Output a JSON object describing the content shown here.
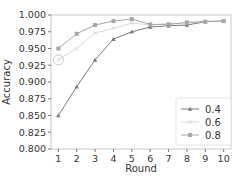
{
  "chart_data": {
    "type": "line",
    "title": "",
    "xlabel": "Round",
    "ylabel": "Accuracy",
    "x": [
      1,
      2,
      3,
      4,
      5,
      6,
      7,
      8,
      9,
      10
    ],
    "xticks": [
      "1",
      "2",
      "3",
      "4",
      "5",
      "6",
      "7",
      "8",
      "9",
      "10"
    ],
    "yticks": [
      "0.800",
      "0.825",
      "0.850",
      "0.875",
      "0.900",
      "0.925",
      "0.950",
      "0.975",
      "1.000"
    ],
    "ylim": [
      0.8,
      1.0
    ],
    "xlim": [
      0.6,
      10.4
    ],
    "grid": false,
    "legend_position": "lower right",
    "series": [
      {
        "name": "0.4",
        "marker": "triangle",
        "color": "#7a7a7a",
        "values": [
          0.85,
          0.893,
          0.933,
          0.964,
          0.975,
          0.982,
          0.984,
          0.985,
          0.99,
          0.991
        ]
      },
      {
        "name": "0.6",
        "marker": "x",
        "color": "#d9d9d9",
        "values": [
          0.933,
          0.95,
          0.973,
          0.98,
          0.988,
          0.985,
          0.987,
          0.988,
          0.991,
          0.991
        ]
      },
      {
        "name": "0.8",
        "marker": "square",
        "color": "#a6a6a6",
        "values": [
          0.95,
          0.972,
          0.985,
          0.991,
          0.994,
          0.986,
          0.986,
          0.989,
          0.99,
          0.991
        ]
      }
    ],
    "annotations": [
      {
        "type": "circle",
        "x": 1,
        "y": 0.933,
        "series": "0.6"
      }
    ]
  }
}
